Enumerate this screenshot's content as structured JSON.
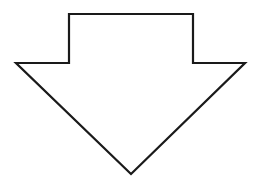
{
  "diagram": {
    "shape": "down-arrow",
    "fill": "#ffffff",
    "stroke": "#1a1a1a",
    "stroke_width": 2.2,
    "points": "69,14 193,14 193,63 245,63 131,174 16,63 69,63"
  }
}
